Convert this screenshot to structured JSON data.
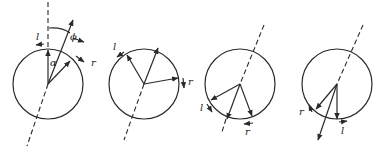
{
  "figure": {
    "panels": [
      {
        "id": "panel-1",
        "labels": {
          "l": "l",
          "r": "r",
          "alpha": "α",
          "phi": "ϕ"
        }
      },
      {
        "id": "panel-2",
        "labels": {
          "l": "l",
          "r": "r"
        }
      },
      {
        "id": "panel-3",
        "labels": {
          "l": "l",
          "r": "r"
        }
      },
      {
        "id": "panel-4",
        "labels": {
          "l": "l",
          "r": "r"
        }
      }
    ],
    "colors": {
      "ink": "#2a2a2a",
      "background": "#ffffff"
    }
  }
}
